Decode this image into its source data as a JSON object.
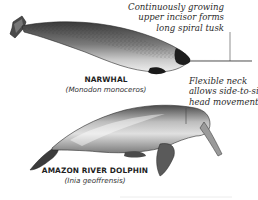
{
  "figure": {
    "type": "comparative anatomy illustration",
    "background": "#ffffff",
    "ink_color": "#1f1f1f"
  },
  "animals": [
    {
      "id": "narwhal",
      "common_name": "NARWHAL",
      "scientific_name": "(Monodon monoceros)",
      "callout": {
        "lines": [
          "Continuously growing",
          "upper incisor forms",
          "long spiral tusk"
        ],
        "points_to": "tusk"
      }
    },
    {
      "id": "amazon-river-dolphin",
      "common_name": "AMAZON RIVER DOLPHIN",
      "scientific_name": "(Inia geoffrensis)",
      "callout": {
        "lines": [
          "Flexible neck",
          "allows side-to-side",
          "head movement"
        ],
        "points_to": "neck"
      }
    }
  ]
}
